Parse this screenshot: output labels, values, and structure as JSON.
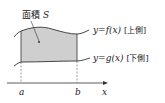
{
  "diagram": {
    "area_label": "面積",
    "area_symbol": "S",
    "upper_curve": {
      "eq_y": "y",
      "eq_eq": "=",
      "eq_fn": "f(x)",
      "tag": "[上側]"
    },
    "lower_curve": {
      "eq_y": "y",
      "eq_eq": "=",
      "eq_fn": "g(x)",
      "tag": "[下側]"
    },
    "axis": {
      "label": "x",
      "a": "a",
      "b": "b"
    },
    "colors": {
      "fill": "#cfcfcf",
      "stroke": "#333333"
    }
  }
}
